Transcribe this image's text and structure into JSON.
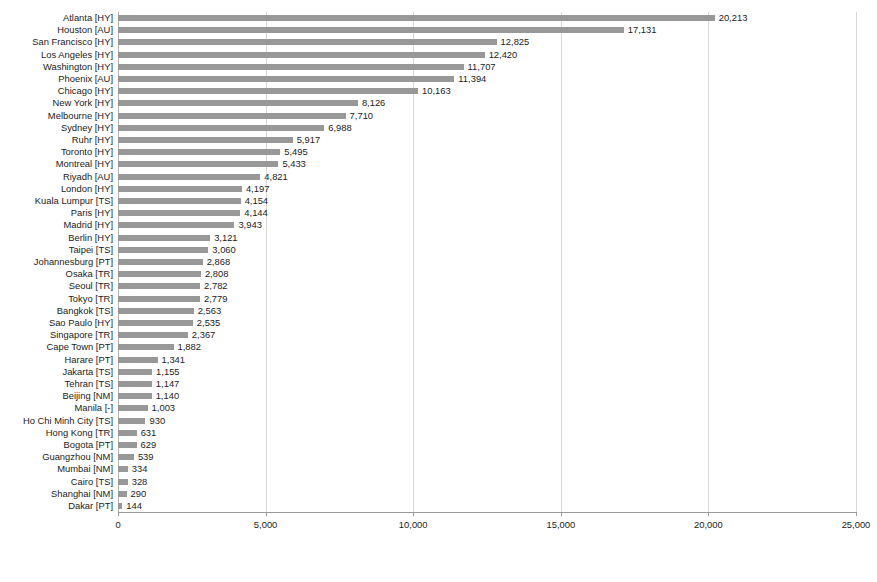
{
  "chart_data": {
    "type": "bar",
    "orientation": "horizontal",
    "title": "",
    "xlabel": "",
    "ylabel": "",
    "xlim": [
      0,
      25000
    ],
    "xticks": [
      0,
      5000,
      10000,
      15000,
      20000,
      25000
    ],
    "xtick_labels": [
      "0",
      "5,000",
      "10,000",
      "15,000",
      "20,000",
      "25,000"
    ],
    "grid": "vertical",
    "legend": "none",
    "bar_color": "#989898",
    "gridline_color": "#d8d8d8",
    "axis_color": "#9a9a9a",
    "categories": [
      "Atlanta [HY]",
      "Houston [AU]",
      "San Francisco [HY]",
      "Los Angeles [HY]",
      "Washington [HY]",
      "Phoenix [AU]",
      "Chicago [HY]",
      "New York [HY]",
      "Melbourne [HY]",
      "Sydney [HY]",
      "Ruhr [HY]",
      "Toronto [HY]",
      "Montreal [HY]",
      "Riyadh [AU]",
      "London [HY]",
      "Kuala Lumpur [TS]",
      "Paris [HY]",
      "Madrid [HY]",
      "Berlin [HY]",
      "Taipei [TS]",
      "Johannesburg [PT]",
      "Osaka [TR]",
      "Seoul [TR]",
      "Tokyo [TR]",
      "Bangkok [TS]",
      "Sao Paulo [HY]",
      "Singapore [TR]",
      "Cape Town [PT]",
      "Harare [PT]",
      "Jakarta [TS]",
      "Tehran [TS]",
      "Beijing [NM]",
      "Manila [-]",
      "Ho Chi Minh City [TS]",
      "Hong Kong [TR]",
      "Bogota [PT]",
      "Guangzhou [NM]",
      "Mumbai [NM]",
      "Cairo [TS]",
      "Shanghai [NM]",
      "Dakar [PT]"
    ],
    "values": [
      20213,
      17131,
      12825,
      12420,
      11707,
      11394,
      10163,
      8126,
      7710,
      6988,
      5917,
      5495,
      5433,
      4821,
      4197,
      4154,
      4144,
      3943,
      3121,
      3060,
      2868,
      2808,
      2782,
      2779,
      2563,
      2535,
      2367,
      1882,
      1341,
      1155,
      1147,
      1140,
      1003,
      930,
      631,
      629,
      539,
      334,
      328,
      290,
      144
    ],
    "value_labels": [
      "20,213",
      "17,131",
      "12,825",
      "12,420",
      "11,707",
      "11,394",
      "10,163",
      "8,126",
      "7,710",
      "6,988",
      "5,917",
      "5,495",
      "5,433",
      "4,821",
      "4,197",
      "4,154",
      "4,144",
      "3,943",
      "3,121",
      "3,060",
      "2,868",
      "2,808",
      "2,782",
      "2,779",
      "2,563",
      "2,535",
      "2,367",
      "1,882",
      "1,341",
      "1,155",
      "1,147",
      "1,140",
      "1,003",
      "930",
      "631",
      "629",
      "539",
      "334",
      "328",
      "290",
      "144"
    ]
  }
}
